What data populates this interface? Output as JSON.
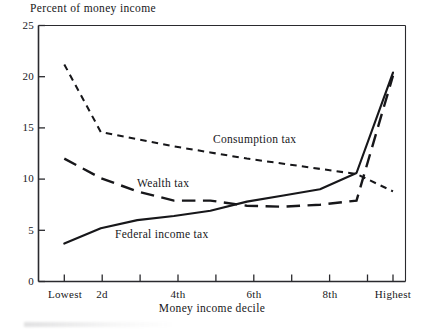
{
  "chart_data": {
    "type": "line",
    "title": "",
    "ylabel": "Percent of money income",
    "xlabel": "Money income decile",
    "ylim": [
      0,
      25
    ],
    "yticks": [
      0,
      5,
      10,
      15,
      20,
      25
    ],
    "ytick_labels": [
      "0",
      "5",
      "10",
      "15",
      "20",
      "25"
    ],
    "grid": false,
    "legend_position": "inline-annotations",
    "x": [
      1,
      2,
      3,
      4,
      5,
      6,
      7,
      8,
      9,
      10
    ],
    "categories": [
      "Lowest",
      "2d",
      "3d",
      "4th",
      "5th",
      "6th",
      "7th",
      "8th",
      "9th",
      "Highest"
    ],
    "xtick_labels": [
      "Lowest",
      "2d",
      "4th",
      "6th",
      "8th",
      "Highest"
    ],
    "xtick_label_positions": [
      1,
      2,
      4,
      6,
      8,
      10
    ],
    "series": [
      {
        "name": "Consumption tax",
        "style": "short-dashed",
        "values": [
          21.2,
          14.6,
          13.9,
          13.2,
          12.6,
          12.0,
          11.5,
          11.0,
          10.5,
          8.8
        ]
      },
      {
        "name": "Wealth tax",
        "style": "long-dashed",
        "values": [
          12.0,
          10.1,
          8.8,
          7.9,
          7.9,
          7.4,
          7.3,
          7.5,
          7.9,
          20.1
        ]
      },
      {
        "name": "Federal income tax",
        "style": "solid",
        "values": [
          3.7,
          5.2,
          6.0,
          6.4,
          6.9,
          7.8,
          8.4,
          9.0,
          10.6,
          20.4
        ]
      }
    ],
    "annotations": [
      {
        "text": "Consumption tax",
        "x": 5.9,
        "y": 12.9
      },
      {
        "text": "Wealth tax",
        "x": 3.45,
        "y": 9.85
      },
      {
        "text": "Federal income tax",
        "x": 2.9,
        "y": 4.45
      }
    ]
  },
  "axis": {
    "y_title": "Percent of money income",
    "x_title": "Money income decile"
  }
}
